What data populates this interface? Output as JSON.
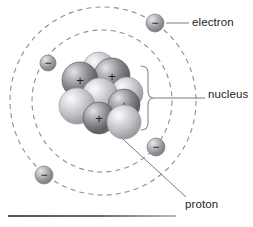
{
  "figure": {
    "title_text": "",
    "type": "atom-diagram",
    "background_color": "#ffffff",
    "labels": {
      "electron": "electron",
      "nucleus": "nucleus",
      "proton": "proton"
    },
    "charge_symbols": {
      "proton": "+",
      "electron": "−"
    },
    "colors": {
      "orbit_stroke": "#8f8f96",
      "leader_line": "#7d7d83",
      "brace": "#8a8a8a",
      "text": "#231f20",
      "proton_sphere_dark": "#6f6f74",
      "proton_sphere_light": "#d8d8dc",
      "neutron_sphere_dark": "#9a9a9e",
      "neutron_sphere_light": "#efeff1",
      "electron_sphere_dark": "#75757a",
      "electron_sphere_light": "#cfcfd4",
      "rule": "#555555"
    },
    "orbits": [
      {
        "name": "outer-orbit",
        "cx": 103,
        "cy": 101,
        "rx": 93,
        "ry": 94
      },
      {
        "name": "inner-orbit",
        "cx": 102,
        "cy": 101,
        "rx": 70,
        "ry": 71
      }
    ],
    "electrons": [
      {
        "name": "electron-top-right",
        "cx": 155,
        "cy": 23,
        "r": 9
      },
      {
        "name": "electron-upper-left",
        "cx": 48,
        "cy": 63,
        "r": 8
      },
      {
        "name": "electron-right",
        "cx": 156,
        "cy": 147,
        "r": 9
      },
      {
        "name": "electron-lower-left",
        "cx": 44,
        "cy": 175,
        "r": 9
      }
    ],
    "nucleus_particles": [
      {
        "name": "neutron-back-top",
        "kind": "neutron",
        "cx": 99,
        "cy": 68,
        "r": 16
      },
      {
        "name": "proton-top-right",
        "kind": "proton",
        "cx": 112,
        "cy": 76,
        "r": 18
      },
      {
        "name": "proton-top-left",
        "kind": "proton",
        "cx": 80,
        "cy": 80,
        "r": 18
      },
      {
        "name": "neutron-right-upper",
        "kind": "neutron",
        "cx": 127,
        "cy": 93,
        "r": 16
      },
      {
        "name": "neutron-center",
        "kind": "neutron",
        "cx": 100,
        "cy": 96,
        "r": 18
      },
      {
        "name": "proton-right",
        "kind": "proton",
        "cx": 124,
        "cy": 105,
        "r": 16
      },
      {
        "name": "neutron-left",
        "kind": "neutron",
        "cx": 77,
        "cy": 106,
        "r": 18
      },
      {
        "name": "proton-bottom",
        "kind": "proton",
        "cx": 99,
        "cy": 118,
        "r": 16
      },
      {
        "name": "neutron-bottom-right",
        "kind": "neutron",
        "cx": 124,
        "cy": 122,
        "r": 17
      }
    ],
    "leaders": [
      {
        "name": "leader-electron",
        "x1": 166,
        "y1": 23,
        "x2": 189,
        "y2": 23
      },
      {
        "name": "leader-nucleus",
        "x1": 154,
        "y1": 98,
        "x2": 205,
        "y2": 98
      },
      {
        "name": "leader-proton",
        "x1": 100,
        "y1": 118,
        "x2": 186,
        "y2": 197
      }
    ],
    "brace": {
      "name": "nucleus-brace",
      "x": 148,
      "y_top": 66,
      "y_bottom": 130,
      "tip_x": 154,
      "mid_y": 98
    },
    "bottom_rule": {
      "name": "bottom-rule",
      "x": 8,
      "y": 215,
      "width": 168
    }
  }
}
